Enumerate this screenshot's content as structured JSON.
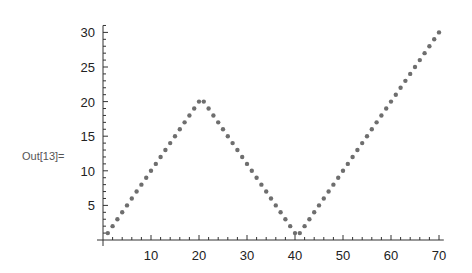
{
  "cell": {
    "out_label": "Out[13]="
  },
  "chart_data": {
    "type": "scatter",
    "title": "",
    "xlabel": "",
    "ylabel": "",
    "xlim": [
      0,
      71
    ],
    "ylim": [
      0,
      31
    ],
    "x_ticks": [
      10,
      20,
      30,
      40,
      50,
      60,
      70
    ],
    "y_ticks": [
      5,
      10,
      15,
      20,
      25,
      30
    ],
    "grid": false,
    "legend": null,
    "point_color": "#6e6e6e",
    "series": [
      {
        "name": "data",
        "x": [
          1,
          2,
          3,
          4,
          5,
          6,
          7,
          8,
          9,
          10,
          11,
          12,
          13,
          14,
          15,
          16,
          17,
          18,
          19,
          20,
          21,
          22,
          23,
          24,
          25,
          26,
          27,
          28,
          29,
          30,
          31,
          32,
          33,
          34,
          35,
          36,
          37,
          38,
          39,
          40,
          41,
          42,
          43,
          44,
          45,
          46,
          47,
          48,
          49,
          50,
          51,
          52,
          53,
          54,
          55,
          56,
          57,
          58,
          59,
          60,
          61,
          62,
          63,
          64,
          65,
          66,
          67,
          68,
          69,
          70
        ],
        "values": [
          1,
          2,
          3,
          4,
          5,
          6,
          7,
          8,
          9,
          10,
          11,
          12,
          13,
          14,
          15,
          16,
          17,
          18,
          19,
          20,
          20,
          19,
          18,
          17,
          16,
          15,
          14,
          13,
          12,
          11,
          10,
          9,
          8,
          7,
          6,
          5,
          4,
          3,
          2,
          1,
          1,
          2,
          3,
          4,
          5,
          6,
          7,
          8,
          9,
          10,
          11,
          12,
          13,
          14,
          15,
          16,
          17,
          18,
          19,
          20,
          21,
          22,
          23,
          24,
          25,
          26,
          27,
          28,
          29,
          30
        ]
      }
    ]
  }
}
